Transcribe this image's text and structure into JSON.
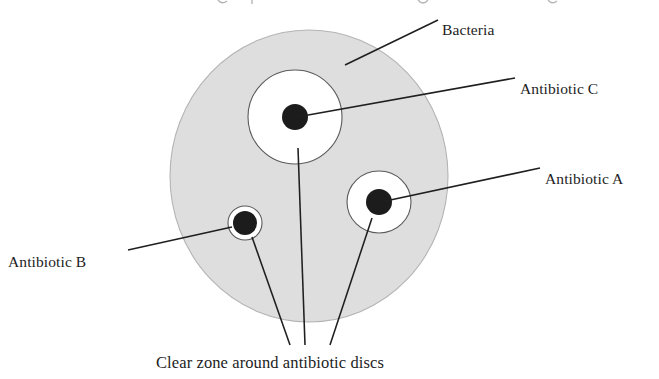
{
  "figure": {
    "type": "diagram",
    "background_color": "#ffffff",
    "plate_fill_color": "#dedede",
    "plate_stroke_color": "#b4b4b4",
    "zone_fill_color": "#ffffff",
    "zone_stroke_color": "#5a5a5a",
    "disc_color": "#1c1c1c",
    "leader_line_color": "#1f1f1f"
  },
  "cut_off_heading": {
    "text": "",
    "note": "top line of page text is clipped; only descender fragments visible"
  },
  "labels": {
    "bacteria": "Bacteria",
    "antibiotic_c": "Antibiotic C",
    "antibiotic_a": "Antibiotic A",
    "antibiotic_b": "Antibiotic B",
    "caption": "Clear zone around antibiotic discs"
  },
  "plate": {
    "name": "agar-plate",
    "center_x": 309,
    "center_y": 176,
    "radius_x": 139,
    "radius_y": 146
  },
  "zones": [
    {
      "id": "zone-c",
      "antibiotic": "Antibiotic C",
      "center_x": 295,
      "center_y": 117,
      "zone_radius_x": 47,
      "zone_radius_y": 47,
      "disc_radius": 13,
      "inhibition": "large"
    },
    {
      "id": "zone-a",
      "antibiotic": "Antibiotic A",
      "center_x": 379,
      "center_y": 202,
      "zone_radius_x": 32,
      "zone_radius_y": 31,
      "disc_radius": 13,
      "inhibition": "medium"
    },
    {
      "id": "zone-b",
      "antibiotic": "Antibiotic B",
      "center_x": 245,
      "center_y": 223,
      "zone_radius_x": 17,
      "zone_radius_y": 17,
      "disc_radius": 12,
      "inhibition": "small"
    }
  ],
  "leaders": {
    "bacteria": {
      "x1": 345,
      "y1": 65,
      "x2": 438,
      "y2": 20
    },
    "antibiotic_c": {
      "x1": 297,
      "y1": 117,
      "x2": 515,
      "y2": 78
    },
    "antibiotic_a": {
      "x1": 381,
      "y1": 202,
      "x2": 540,
      "y2": 168
    },
    "antibiotic_b": {
      "x1": 232,
      "y1": 227,
      "x2": 128,
      "y2": 250
    },
    "caption_to_zone_b": {
      "x1": 252,
      "y1": 237,
      "x2": 290,
      "y2": 345
    },
    "caption_to_zone_c": {
      "x1": 298,
      "y1": 148,
      "x2": 305,
      "y2": 345
    },
    "caption_to_zone_a": {
      "x1": 372,
      "y1": 218,
      "x2": 330,
      "y2": 345
    }
  },
  "text_positions": {
    "bacteria": {
      "x": 442,
      "y": 24
    },
    "antibiotic_c": {
      "x": 520,
      "y": 83
    },
    "antibiotic_a": {
      "x": 545,
      "y": 173
    },
    "antibiotic_b": {
      "x": 8,
      "y": 256
    },
    "caption": {
      "x": 156,
      "y": 368
    }
  }
}
